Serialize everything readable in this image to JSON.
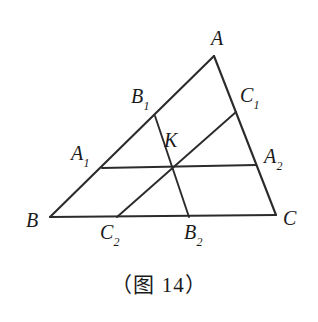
{
  "figure": {
    "caption": "（图 14）",
    "stroke_color": "#2b2b2b",
    "background_color": "#ffffff",
    "label_color": "#1a1a1a"
  },
  "labels": {
    "A": {
      "base": "A",
      "sub": "",
      "x": 211,
      "y": 28
    },
    "B": {
      "base": "B",
      "sub": "",
      "x": 26,
      "y": 210
    },
    "C": {
      "base": "C",
      "sub": "",
      "x": 283,
      "y": 208
    },
    "A1": {
      "base": "A",
      "sub": "1",
      "x": 71,
      "y": 143
    },
    "A2": {
      "base": "A",
      "sub": "2",
      "x": 264,
      "y": 146
    },
    "B1": {
      "base": "B",
      "sub": "1",
      "x": 131,
      "y": 86
    },
    "B2": {
      "base": "B",
      "sub": "2",
      "x": 184,
      "y": 222
    },
    "C1": {
      "base": "C",
      "sub": "1",
      "x": 240,
      "y": 85
    },
    "C2": {
      "base": "C",
      "sub": "2",
      "x": 100,
      "y": 222
    },
    "K": {
      "base": "K",
      "sub": "",
      "x": 164,
      "y": 130
    }
  },
  "geometry": {
    "points": {
      "A": {
        "x": 214,
        "y": 56
      },
      "B": {
        "x": 50,
        "y": 217
      },
      "C": {
        "x": 276,
        "y": 215
      },
      "A1": {
        "x": 102,
        "y": 168
      },
      "A2": {
        "x": 256,
        "y": 165
      },
      "B1": {
        "x": 155,
        "y": 116
      },
      "B2": {
        "x": 189,
        "y": 217
      },
      "C1": {
        "x": 236,
        "y": 112
      },
      "C2": {
        "x": 117,
        "y": 217
      },
      "K": {
        "x": 174,
        "y": 167
      }
    },
    "segments": [
      {
        "name": "side-AB",
        "from": "A",
        "to": "B"
      },
      {
        "name": "side-AC",
        "from": "A",
        "to": "C"
      },
      {
        "name": "side-BC",
        "from": "B",
        "to": "C"
      },
      {
        "name": "cevian-A1-A2",
        "from": "A1",
        "to": "A2"
      },
      {
        "name": "cevian-B1-B2",
        "from": "B1",
        "to": "B2"
      },
      {
        "name": "cevian-C1-C2",
        "from": "C1",
        "to": "C2"
      }
    ],
    "concurrency_point": "K"
  }
}
